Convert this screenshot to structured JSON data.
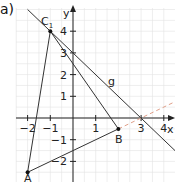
{
  "task_label": "a)",
  "axes": {
    "x_label": "x",
    "y_label": "y",
    "x_ticks": [
      {
        "value": -2,
        "label": "−2"
      },
      {
        "value": -1,
        "label": "−1"
      },
      {
        "value": 1,
        "label": "1"
      },
      {
        "value": 3,
        "label": "3"
      },
      {
        "value": 4,
        "label": "4"
      }
    ],
    "y_ticks": [
      {
        "value": 4,
        "label": "4"
      },
      {
        "value": 3,
        "label": "3"
      },
      {
        "value": 2,
        "label": "2"
      },
      {
        "value": 1,
        "label": "1"
      },
      {
        "value": -1,
        "label": "−1"
      },
      {
        "value": -2,
        "label": "−2"
      }
    ]
  },
  "points": {
    "A": {
      "label": "A",
      "x": -2,
      "y": -2.5
    },
    "B": {
      "label": "B",
      "x": 2,
      "y": -0.5
    },
    "C1": {
      "label": "C",
      "sub": "1",
      "x": -1,
      "y": 4
    }
  },
  "line_g": {
    "label": "g",
    "equation": "y = -x + 3"
  },
  "colors": {
    "grid": "#e2e2e2",
    "axis": "#222222",
    "line": "#333333",
    "dashed": "#e0a08a"
  }
}
